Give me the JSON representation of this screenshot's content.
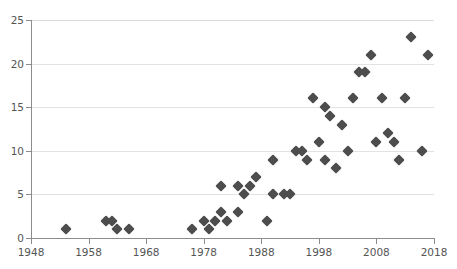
{
  "chart_data": {
    "type": "scatter",
    "title": "",
    "subtitle": "",
    "xlabel": "",
    "ylabel": "",
    "xlim": [
      1948,
      2018
    ],
    "ylim": [
      0,
      25
    ],
    "xticks": [
      1948,
      1958,
      1968,
      1978,
      1988,
      1998,
      2008,
      2018
    ],
    "xtick_labels": [
      "1948",
      "1958",
      "1968",
      "1978",
      "1988",
      "1998",
      "2008",
      "2018"
    ],
    "yticks": [
      0,
      5,
      10,
      15,
      20,
      25
    ],
    "ytick_labels": [
      "0",
      "5",
      "10",
      "15",
      "20",
      "25"
    ],
    "grid": "horizontal",
    "legend": "none",
    "marker": "diamond",
    "marker_color": "#4d4d4d",
    "gridline_color": "#e2e2e2",
    "axis_color": "#8c8c8c",
    "tick_label_color": "#555555",
    "background_color": "#ffffff",
    "points": [
      {
        "x": 1954,
        "y": 1
      },
      {
        "x": 1961,
        "y": 2
      },
      {
        "x": 1962,
        "y": 2
      },
      {
        "x": 1963,
        "y": 1
      },
      {
        "x": 1965,
        "y": 1
      },
      {
        "x": 1976,
        "y": 1
      },
      {
        "x": 1978,
        "y": 2
      },
      {
        "x": 1979,
        "y": 1
      },
      {
        "x": 1980,
        "y": 2
      },
      {
        "x": 1981,
        "y": 3
      },
      {
        "x": 1981,
        "y": 6
      },
      {
        "x": 1982,
        "y": 2
      },
      {
        "x": 1984,
        "y": 3
      },
      {
        "x": 1984,
        "y": 6
      },
      {
        "x": 1985,
        "y": 5
      },
      {
        "x": 1986,
        "y": 6
      },
      {
        "x": 1987,
        "y": 7
      },
      {
        "x": 1989,
        "y": 2
      },
      {
        "x": 1990,
        "y": 5
      },
      {
        "x": 1990,
        "y": 9
      },
      {
        "x": 1992,
        "y": 5
      },
      {
        "x": 1993,
        "y": 5
      },
      {
        "x": 1994,
        "y": 10
      },
      {
        "x": 1995,
        "y": 10
      },
      {
        "x": 1996,
        "y": 9
      },
      {
        "x": 1997,
        "y": 16
      },
      {
        "x": 1998,
        "y": 11
      },
      {
        "x": 1999,
        "y": 15
      },
      {
        "x": 1999,
        "y": 9
      },
      {
        "x": 2000,
        "y": 14
      },
      {
        "x": 2001,
        "y": 8
      },
      {
        "x": 2002,
        "y": 13
      },
      {
        "x": 2003,
        "y": 10
      },
      {
        "x": 2004,
        "y": 16
      },
      {
        "x": 2005,
        "y": 19
      },
      {
        "x": 2006,
        "y": 19
      },
      {
        "x": 2007,
        "y": 21
      },
      {
        "x": 2008,
        "y": 11
      },
      {
        "x": 2009,
        "y": 16
      },
      {
        "x": 2010,
        "y": 12
      },
      {
        "x": 2011,
        "y": 11
      },
      {
        "x": 2012,
        "y": 9
      },
      {
        "x": 2013,
        "y": 16
      },
      {
        "x": 2014,
        "y": 23
      },
      {
        "x": 2016,
        "y": 10
      },
      {
        "x": 2017,
        "y": 21
      }
    ]
  },
  "geometry": {
    "plot_left": 31,
    "plot_top": 20,
    "plot_width": 403,
    "plot_height": 218
  }
}
